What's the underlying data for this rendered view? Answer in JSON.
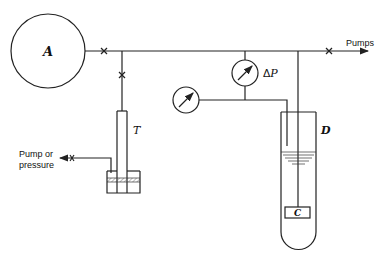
{
  "diagram": {
    "labels": {
      "vessel_a": "A",
      "tube_t": "T",
      "dewar_d": "D",
      "sample_c": "C",
      "delta_p": "ΔP",
      "delta_symbol": "Δ",
      "p_symbol": "P",
      "pumps": "Pumps",
      "pump_or_pressure_line1": "Pump or",
      "pump_or_pressure_line2": "pressure"
    },
    "components": [
      {
        "id": "A",
        "type": "vessel",
        "shape": "circle"
      },
      {
        "id": "T",
        "type": "tube",
        "shape": "rectangle"
      },
      {
        "id": "reservoir",
        "type": "liquid-reservoir",
        "shape": "rectangle"
      },
      {
        "id": "D",
        "type": "dewar",
        "shape": "u-tube"
      },
      {
        "id": "C",
        "type": "sample-container",
        "shape": "rectangle"
      },
      {
        "id": "gauge-delta-p",
        "type": "differential-pressure-gauge"
      },
      {
        "id": "gauge-pressure",
        "type": "pressure-gauge"
      }
    ],
    "valves": [
      "valve-a-line",
      "valve-t-line",
      "valve-pumps",
      "valve-pump-or-pressure"
    ],
    "line_color": "#222222"
  }
}
